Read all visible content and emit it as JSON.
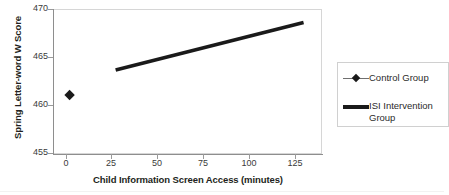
{
  "chart_data": {
    "type": "line",
    "title": "",
    "xlabel": "Child Information Screen Access (minutes)",
    "ylabel": "Spring Letter-word W Score",
    "xlim": [
      -9,
      137
    ],
    "ylim": [
      455,
      470
    ],
    "xticks": [
      0,
      25,
      50,
      75,
      100,
      125
    ],
    "yticks": [
      455,
      460,
      465,
      470
    ],
    "grid": false,
    "legend_position": "right",
    "series": [
      {
        "name": "Control Group",
        "marker": "diamond",
        "linestyle": "none",
        "color": "#1a1a1a",
        "x": [
          0
        ],
        "y": [
          461.1
        ]
      },
      {
        "name": "ISI Intervention Group",
        "marker": "none",
        "linestyle": "thick-solid",
        "color": "#1a1a1a",
        "x": [
          25,
          127
        ],
        "y": [
          463.7,
          468.6
        ]
      }
    ]
  },
  "axes": {
    "y_title": "Spring Letter-word W Score",
    "x_title": "Child Information Screen Access (minutes)",
    "y_tick_labels": [
      "470",
      "465",
      "460",
      "455"
    ],
    "x_tick_labels": [
      "0",
      "25",
      "50",
      "75",
      "100",
      "125"
    ]
  },
  "legend": {
    "entries": [
      {
        "label": "Control Group",
        "swatch": "diamond-marker-with-line"
      },
      {
        "label": "ISI Intervention Group",
        "swatch": "thick-line"
      }
    ]
  },
  "colors": {
    "series": "#1a1a1a",
    "axis": "#8e8e8e",
    "frame": "#d6d6d6",
    "tick_text": "#3a3a3a",
    "background": "#ffffff"
  }
}
